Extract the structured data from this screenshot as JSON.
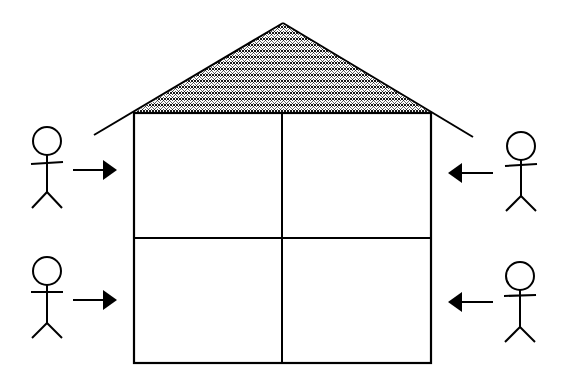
{
  "diagram": {
    "colors": {
      "background": "#ffffff",
      "stroke": "#000000",
      "roof_pattern": "#000000"
    },
    "roof": {
      "pattern": "crosshatch-scales",
      "peak": [
        283,
        23
      ],
      "left_eave": [
        94,
        135
      ],
      "right_eave": [
        473,
        137
      ]
    },
    "house": {
      "left": 134,
      "top": 113,
      "right": 431,
      "bottom": 363,
      "mid_x": 282,
      "mid_y": 238
    },
    "rooms": [
      {
        "id": "top-left",
        "label": ""
      },
      {
        "id": "top-right",
        "label": ""
      },
      {
        "id": "bottom-left",
        "label": ""
      },
      {
        "id": "bottom-right",
        "label": ""
      }
    ],
    "people": [
      {
        "id": "person-top-left",
        "side": "left",
        "cx": 47,
        "cy": 140,
        "arrow_dir": "right"
      },
      {
        "id": "person-bottom-left",
        "side": "left",
        "cx": 47,
        "cy": 270,
        "arrow_dir": "right"
      },
      {
        "id": "person-top-right",
        "side": "right",
        "cx": 520,
        "cy": 145,
        "arrow_dir": "left"
      },
      {
        "id": "person-bottom-right",
        "side": "right",
        "cx": 520,
        "cy": 275,
        "arrow_dir": "left"
      }
    ]
  }
}
